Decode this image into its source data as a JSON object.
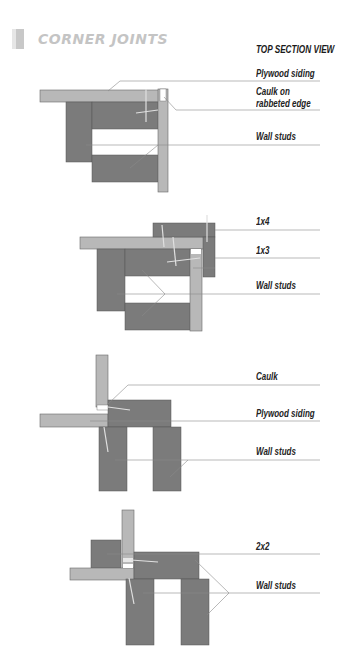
{
  "header": {
    "title": "CORNER JOINTS",
    "view_title": "TOP SECTION VIEW"
  },
  "colors": {
    "stud": "#7b7b7b",
    "siding": "#b8b8b8",
    "leader": "#8a8a8a",
    "title": "#c4c4c4",
    "label": "#222222"
  },
  "diagrams": [
    {
      "name": "rabbeted-corner",
      "labels": [
        "Plywood siding",
        "Caulk on",
        "rabbeted edge",
        "Wall studs"
      ]
    },
    {
      "name": "trim-corner",
      "labels": [
        "1x4",
        "1x3",
        "Wall studs"
      ]
    },
    {
      "name": "butt-corner",
      "labels": [
        "Caulk",
        "Plywood siding",
        "Wall studs"
      ]
    },
    {
      "name": "nailer-corner",
      "labels": [
        "2x2",
        "Wall studs"
      ]
    }
  ]
}
